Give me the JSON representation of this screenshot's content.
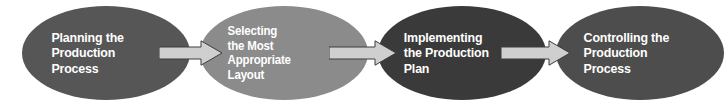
{
  "diagram": {
    "type": "process-flow",
    "orientation": "left-to-right",
    "background_color": "#ffffff",
    "nodes": [
      {
        "id": "planning",
        "shape": "ellipse",
        "label": "Planning the\nProduction\nProcess",
        "lines": [
          "Planning the",
          "Production",
          "Process"
        ],
        "fill_color": "#565656",
        "text_color": "#ffffff"
      },
      {
        "id": "selecting-layout",
        "shape": "ellipse",
        "label": "Selecting\nthe Most\nAppropriate\nLayout",
        "lines": [
          "Selecting",
          "the Most",
          "Appropriate",
          "Layout"
        ],
        "fill_color": "#8b8b8b",
        "text_color": "#ffffff"
      },
      {
        "id": "implementing",
        "shape": "ellipse",
        "label": "Implementing\nthe Production\nPlan",
        "lines": [
          "Implementing",
          "the Production",
          "Plan"
        ],
        "fill_color": "#3a3a3a",
        "text_color": "#ffffff"
      },
      {
        "id": "controlling",
        "shape": "ellipse",
        "label": "Controlling the\nProduction\nProcess",
        "lines": [
          "Controlling the",
          "Production",
          "Process"
        ],
        "fill_color": "#4d4d4d",
        "text_color": "#ffffff"
      }
    ],
    "connectors": [
      {
        "id": "arrow-1",
        "icon": "right-arrow-icon",
        "direction": "right",
        "from": "planning",
        "to": "selecting-layout",
        "fill_color": "#cfcfcf",
        "stroke_color": "#3d3d3d"
      },
      {
        "id": "arrow-2",
        "icon": "right-arrow-icon",
        "direction": "right",
        "from": "selecting-layout",
        "to": "implementing",
        "fill_color": "#cfcfcf",
        "stroke_color": "#3d3d3d"
      },
      {
        "id": "arrow-3",
        "icon": "right-arrow-icon",
        "direction": "right",
        "from": "implementing",
        "to": "controlling",
        "fill_color": "#cfcfcf",
        "stroke_color": "#3d3d3d"
      }
    ]
  }
}
